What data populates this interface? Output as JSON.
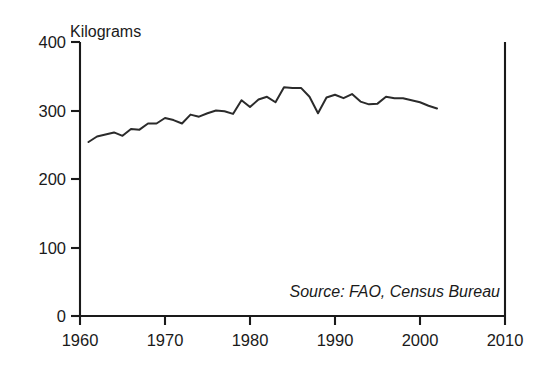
{
  "chart_data": {
    "type": "line",
    "title": "",
    "ylabel": "Kilograms",
    "xlabel": "",
    "xlim": [
      1960,
      2010
    ],
    "ylim": [
      0,
      400
    ],
    "grid": false,
    "legend": null,
    "annotations": [
      {
        "name": "source-note",
        "text": "Source: FAO, Census Bureau",
        "position": "bottom-right-inside-plot",
        "style": "italic"
      }
    ],
    "yticks": [
      0,
      100,
      200,
      300,
      400
    ],
    "ytick_labels": [
      "0",
      "100",
      "200",
      "300",
      "400"
    ],
    "xticks": [
      1960,
      1970,
      1980,
      1990,
      2000,
      2010
    ],
    "xtick_labels": [
      "1960",
      "1970",
      "1980",
      "1990",
      "2000",
      "2010"
    ],
    "series": [
      {
        "name": "Per capita grain supply",
        "color": "#2b2b2b",
        "x": [
          1961,
          1962,
          1963,
          1964,
          1965,
          1966,
          1967,
          1968,
          1969,
          1970,
          1971,
          1972,
          1973,
          1974,
          1975,
          1976,
          1977,
          1978,
          1979,
          1980,
          1981,
          1982,
          1983,
          1984,
          1985,
          1986,
          1987,
          1988,
          1989,
          1990,
          1991,
          1992,
          1993,
          1994,
          1995,
          1996,
          1997,
          1998,
          1999,
          2000,
          2001,
          2002
        ],
        "values": [
          254,
          262,
          265,
          268,
          263,
          273,
          272,
          281,
          281,
          289,
          286,
          281,
          294,
          291,
          296,
          300,
          299,
          295,
          315,
          305,
          316,
          320,
          312,
          334,
          333,
          333,
          320,
          296,
          319,
          323,
          318,
          324,
          313,
          309,
          310,
          320,
          318,
          318,
          315,
          312,
          307,
          303
        ]
      }
    ]
  },
  "axes": {
    "y_axis_title": "Kilograms"
  }
}
